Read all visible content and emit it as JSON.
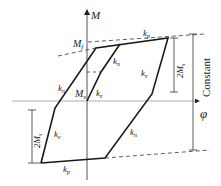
{
  "diagram": {
    "type": "moment-curvature hysteresis model",
    "axes": {
      "y_label": "M",
      "x_label": "φ"
    },
    "labels": {
      "top_moment": "M",
      "top_moment_sub": "f",
      "mid_moment": "M",
      "mid_moment_sub": "s",
      "kp_top": "k",
      "kp_top_sub": "p",
      "kn_left": "k",
      "kn_left_sub": "n",
      "kn_inner": "k",
      "kn_inner_sub": "n",
      "ke_inner": "k",
      "ke_inner_sub": "e",
      "ke_right": "k",
      "ke_right_sub": "e",
      "ke_left": "k",
      "ke_left_sub": "e",
      "kn_right": "k",
      "kn_right_sub": "n",
      "kp_bottom": "k",
      "kp_bottom_sub": "p",
      "dim_right": "2M",
      "dim_right_sub": "s",
      "dim_left": "2M",
      "dim_left_sub": "s",
      "constant": "Constant"
    },
    "colors": {
      "line": "#1a1a1a",
      "dash": "#333333",
      "axis": "#555555"
    }
  }
}
